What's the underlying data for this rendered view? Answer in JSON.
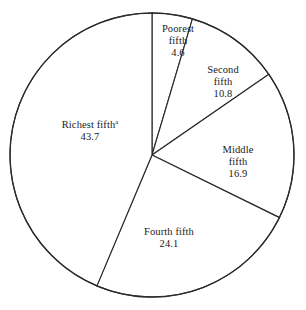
{
  "chart_data": {
    "type": "pie",
    "title": "",
    "xlabel": "",
    "ylabel": "",
    "categories": [
      "Poorest fifth",
      "Second fifth",
      "Middle fifth",
      "Fourth fifth",
      "Richest fifth"
    ],
    "values": [
      4.6,
      10.8,
      16.9,
      24.1,
      43.7
    ],
    "total": 100.0,
    "units": "percent",
    "start_angle_deg": 0,
    "direction": "clockwise",
    "grid": false,
    "legend": "none",
    "labels_inside": true,
    "slices": [
      {
        "name": "Poorest fifth",
        "name_line1": "Poorest",
        "name_line2": "fifth",
        "value": 4.6,
        "value_text": "4.6",
        "footnote_marker": "",
        "fill": "#ffffff",
        "stroke": "#2b2b2b"
      },
      {
        "name": "Second fifth",
        "name_line1": "Second",
        "name_line2": "fifth",
        "value": 10.8,
        "value_text": "10.8",
        "footnote_marker": "",
        "fill": "#ffffff",
        "stroke": "#2b2b2b"
      },
      {
        "name": "Middle fifth",
        "name_line1": "Middle",
        "name_line2": "fifth",
        "value": 16.9,
        "value_text": "16.9",
        "footnote_marker": "",
        "fill": "#ffffff",
        "stroke": "#2b2b2b"
      },
      {
        "name": "Fourth fifth",
        "name_line1": "Fourth fifth",
        "name_line2": "",
        "value": 24.1,
        "value_text": "24.1",
        "footnote_marker": "",
        "fill": "#ffffff",
        "stroke": "#2b2b2b"
      },
      {
        "name": "Richest fifth",
        "name_line1": "Richest fifth",
        "name_line2": "",
        "value": 43.7,
        "value_text": "43.7",
        "footnote_marker": "a",
        "fill": "#ffffff",
        "stroke": "#2b2b2b"
      }
    ],
    "geometry": {
      "center_x": 152,
      "center_y": 155,
      "radius": 142
    },
    "colors": {
      "background": "#ffffff",
      "line": "#2b2b2b",
      "text": "#1a1a1a"
    }
  }
}
